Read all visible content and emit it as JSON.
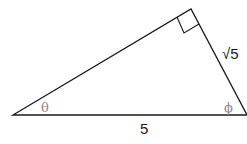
{
  "diagram": {
    "type": "right-triangle",
    "vertices": {
      "left": [
        13,
        115
      ],
      "top": [
        191,
        9
      ],
      "right": [
        247,
        115
      ]
    },
    "right_angle_at": "top",
    "labels": {
      "angle_left": "θ",
      "angle_right": "ϕ",
      "side_short": "√5",
      "side_base": "5"
    },
    "colors": {
      "line": "#1a1a1a",
      "angle_label": "#8a8a8a",
      "side_label": "#1a1a1a"
    }
  }
}
